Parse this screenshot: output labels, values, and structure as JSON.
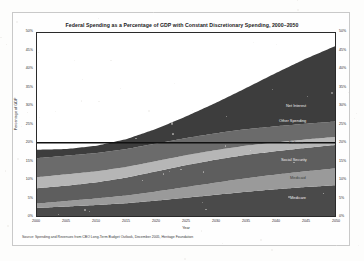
{
  "chart_data": {
    "type": "area",
    "title": "Federal Spending as a Percentage of GDP with Constant Discretionary Spending, 2000–2050",
    "xlabel": "Year",
    "ylabel": "Percentage of GDP",
    "source": "Source: Spending and Revenues from CBO Long-Term Budget Outlook, December 2005, Heritage Foundation",
    "x": [
      2000,
      2005,
      2010,
      2015,
      2020,
      2025,
      2030,
      2035,
      2040,
      2045,
      2050
    ],
    "xticks": [
      "2000",
      "2005",
      "2010",
      "2015",
      "2020",
      "2025",
      "2030",
      "2035",
      "2040",
      "2045",
      "2050"
    ],
    "yticks": [
      "0%",
      "5%",
      "10%",
      "15%",
      "20%",
      "25%",
      "30%",
      "35%",
      "40%",
      "45%",
      "50%"
    ],
    "ylim": [
      0,
      50
    ],
    "xlim": [
      2000,
      2050
    ],
    "grid": false,
    "legend_position": "inline-series-labels",
    "stacked": true,
    "series": [
      {
        "name": "Medicare",
        "color": "#4a4a4a",
        "values": [
          2.2,
          2.6,
          3.0,
          3.5,
          4.2,
          5.0,
          5.8,
          6.6,
          7.3,
          7.9,
          8.4
        ]
      },
      {
        "name": "Medicaid",
        "color": "#9a9a9a",
        "values": [
          1.2,
          1.5,
          1.8,
          2.1,
          2.5,
          2.9,
          3.3,
          3.7,
          4.0,
          4.3,
          4.6
        ]
      },
      {
        "name": "Social Security",
        "color": "#5e5e5e",
        "values": [
          4.2,
          4.2,
          4.4,
          4.9,
          5.5,
          6.0,
          6.3,
          6.4,
          6.4,
          6.4,
          6.4
        ]
      },
      {
        "name": "Defense",
        "color": "#b6b6b6",
        "values": [
          3.0,
          3.1,
          3.0,
          2.9,
          2.8,
          2.7,
          2.6,
          2.5,
          2.4,
          2.3,
          2.2
        ]
      },
      {
        "name": "Other Spending",
        "color": "#6b6b6b",
        "values": [
          5.2,
          5.1,
          5.0,
          4.9,
          4.8,
          4.7,
          4.6,
          4.5,
          4.4,
          4.3,
          4.2
        ]
      },
      {
        "name": "Net Interest",
        "color": "#3d3d3d",
        "values": [
          2.3,
          1.8,
          2.0,
          2.7,
          4.0,
          5.9,
          8.3,
          11.2,
          14.5,
          17.7,
          20.6
        ]
      }
    ],
    "revenue_line": {
      "name": "Revenue",
      "value": 20.0,
      "color": "#111111"
    },
    "series_label_positions": [
      {
        "name": "Net Interest",
        "x": 286,
        "y": 104
      },
      {
        "name": "Other Spending",
        "x": 279,
        "y": 119
      },
      {
        "name": "Defense",
        "x": 289,
        "y": 141
      },
      {
        "name": "Social Security",
        "x": 281,
        "y": 158
      },
      {
        "name": "Medicaid",
        "x": 290,
        "y": 176
      },
      {
        "name": "Medicare",
        "x": 290,
        "y": 196
      }
    ]
  }
}
